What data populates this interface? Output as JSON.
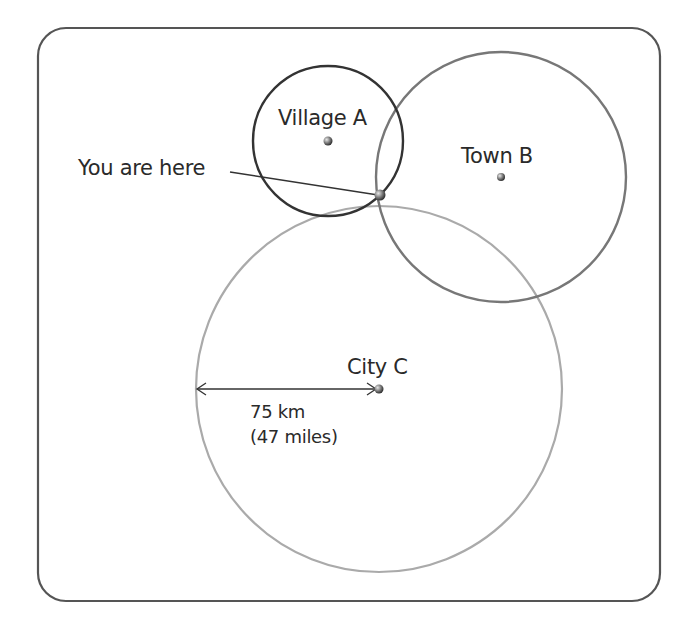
{
  "diagram": {
    "frame": {
      "x": 38,
      "y": 28,
      "w": 622,
      "h": 573,
      "radius": 28,
      "stroke": "#555555"
    },
    "locations": [
      {
        "id": "village-a",
        "label": "Village A",
        "cx": 328,
        "cy": 141,
        "r": 75,
        "stroke": "#333333"
      },
      {
        "id": "town-b",
        "label": "Town B",
        "cx": 501,
        "cy": 177,
        "r": 125,
        "stroke": "#777777"
      },
      {
        "id": "city-c",
        "label": "City C",
        "cx": 379,
        "cy": 389,
        "r": 183,
        "stroke": "#aaaaaa"
      }
    ],
    "you_are_here": {
      "label": "You are here",
      "x": 380,
      "y": 195
    },
    "radius_marker": {
      "distance_km": "75 km",
      "distance_miles": "(47 miles)",
      "x1": 197,
      "y1": 389,
      "x2": 377,
      "y2": 389
    }
  }
}
